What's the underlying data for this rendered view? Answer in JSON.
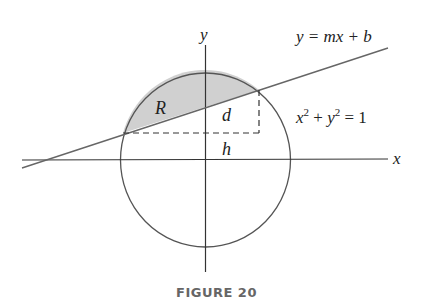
{
  "figure": {
    "caption": "FIGURE 20",
    "labels": {
      "y_axis": "y",
      "x_axis": "x",
      "line_equation": "y = mx + b",
      "circle_equation_x": "x",
      "circle_equation_plus": " + ",
      "circle_equation_y": "y",
      "circle_equation_eq": " = 1",
      "exponent": "2",
      "region": "R",
      "distance": "d",
      "height": "h"
    },
    "colors": {
      "shaded_region": "#d0d0d0",
      "stroke": "#555555",
      "axis": "#333333",
      "caption": "#666666"
    }
  }
}
